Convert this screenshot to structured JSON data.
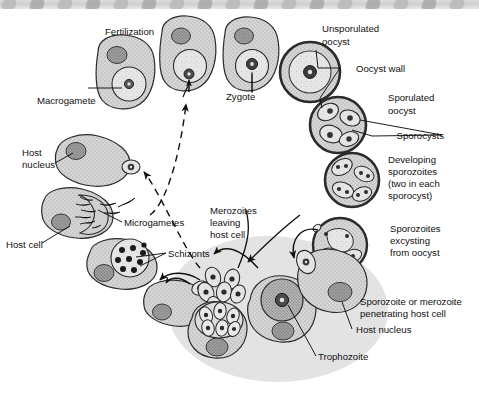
{
  "figure": {
    "type": "biological-cycle-diagram",
    "background_color": "#ffffff",
    "host_cell_zone_color": "#e2e2e2",
    "cell_fill_color": "#cfcfcf",
    "nucleus_fill_color": "#9a9a9a",
    "outline_color": "#2b2b2b"
  },
  "labels": {
    "fertilization": "Fertilization",
    "macrogamete": "Macrogamete",
    "host_nucleus_left": "Host\nnucleus",
    "host_nucleus_left_line1": "Host",
    "host_nucleus_left_line2": "nucleus",
    "host_cell": "Host cell",
    "microgametes": "Microgametes",
    "schizonts": "Schizonts",
    "zygote": "Zygote",
    "unsporulated_oocyst_line1": "Unsporulated",
    "unsporulated_oocyst_line2": "oocyst",
    "oocyst_wall": "Oocyst wall",
    "sporulated_oocyst_line1": "Sporulated",
    "sporulated_oocyst_line2": "oocyst",
    "sporocysts": "Sporocysts",
    "developing_sporozoites_line1": "Developing",
    "developing_sporozoites_line2": "sporozoites",
    "developing_sporozoites_line3": "(two in each",
    "developing_sporozoites_line4": "sporocyst)",
    "sporozoites_excysting_line1": "Sporozoites",
    "sporozoites_excysting_line2": "excysting",
    "sporozoites_excysting_line3": "from oocyst",
    "merozoites_leaving_line1": "Merozoites",
    "merozoites_leaving_line2": "leaving",
    "merozoites_leaving_line3": "host cell",
    "penetrating_line1": "Sporozoite or merozoite",
    "penetrating_line2": "penetrating host cell",
    "host_nucleus_right": "Host nucleus",
    "trophozoite": "Trophozoite"
  },
  "stages": [
    {
      "id": "macrogamete",
      "label": "Macrogamete",
      "description": "Host cell containing a large macrogamete with prominent nucleus"
    },
    {
      "id": "fertilization",
      "label": "Fertilization",
      "description": "Microgamete fusing with macrogamete inside host cell"
    },
    {
      "id": "zygote",
      "label": "Zygote",
      "description": "Fertilized zygote inside host cell"
    },
    {
      "id": "unsporulated-oocyst",
      "label": "Unsporulated oocyst",
      "description": "Round oocyst with thick wall and single central mass"
    },
    {
      "id": "sporulated-oocyst",
      "label": "Sporulated oocyst",
      "description": "Oocyst containing four sporocysts"
    },
    {
      "id": "developing-sporozoites",
      "label": "Developing sporozoites (two in each sporocyst)",
      "description": "Oocyst with sporocysts each containing two sporozoites"
    },
    {
      "id": "sporozoites-excysting",
      "label": "Sporozoites excysting from oocyst",
      "description": "Sporozoites emerging from ruptured oocyst"
    },
    {
      "id": "penetrating-cell",
      "label": "Sporozoite or merozoite penetrating host cell",
      "description": "Elongated zoite entering a host cell"
    },
    {
      "id": "trophozoite",
      "label": "Trophozoite",
      "description": "Rounded intracellular trophozoite within host cell"
    },
    {
      "id": "schizont-merozoites",
      "label": "Merozoites leaving host cell",
      "description": "Mature schizont releasing merozoites"
    },
    {
      "id": "schizonts",
      "label": "Schizonts",
      "description": "Host cell containing a schizont with many nuclei"
    },
    {
      "id": "microgametes",
      "label": "Microgametes",
      "description": "Microgametocyte releasing flagellated microgametes"
    },
    {
      "id": "host-cell",
      "label": "Host cell",
      "description": "Host cell with host nucleus"
    }
  ],
  "arrows": [
    {
      "from": "merozoites",
      "to": "host-cell-gamete",
      "style": "dashed"
    },
    {
      "from": "microgametes",
      "to": "fertilization",
      "style": "dashed"
    },
    {
      "from": "schizonts",
      "to": "trophozoite-cell",
      "style": "solid"
    },
    {
      "from": "merozoites-cluster",
      "to": "schizont",
      "style": "solid"
    },
    {
      "from": "sporozoites-excysting",
      "to": "penetrating-cell",
      "style": "solid"
    },
    {
      "from": "trophozoite-zone",
      "to": "merozoites-leaving",
      "style": "solid"
    }
  ]
}
